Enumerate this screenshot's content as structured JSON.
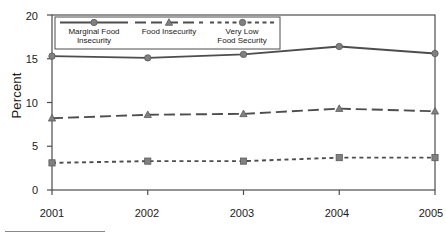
{
  "chart_data": {
    "type": "line",
    "title": "",
    "xlabel": "",
    "ylabel": "Percent",
    "categories": [
      "2001",
      "2002",
      "2003",
      "2004",
      "2005"
    ],
    "x": [
      2001,
      2002,
      2003,
      2004,
      2005
    ],
    "ylim": [
      0,
      20
    ],
    "yticks": [
      0,
      5,
      10,
      15,
      20
    ],
    "ytick_labels": [
      "0",
      "5",
      "10",
      "15",
      "20"
    ],
    "grid": false,
    "legend_position": "upper-left-inside",
    "series": [
      {
        "name": "Marginal Food Insecurity",
        "marker": "circle",
        "linestyle": "solid",
        "color": "#4d4d4d",
        "values": [
          15.3,
          15.1,
          15.5,
          16.4,
          15.6
        ]
      },
      {
        "name": "Food Insecurity",
        "marker": "triangle",
        "linestyle": "dashed",
        "color": "#4d4d4d",
        "values": [
          8.2,
          8.6,
          8.7,
          9.3,
          9.0
        ]
      },
      {
        "name": "Very Low Food Security",
        "marker": "square",
        "linestyle": "dotted",
        "color": "#4d4d4d",
        "values": [
          3.1,
          3.3,
          3.3,
          3.7,
          3.7
        ]
      }
    ]
  },
  "axes": {
    "ylabel": "Percent",
    "ytick_labels": [
      "20",
      "15",
      "10",
      "5",
      "0"
    ],
    "xtick_labels": [
      "2001",
      "2002",
      "2003",
      "2004",
      "2005"
    ]
  },
  "legend": {
    "items": [
      {
        "line1": "Marginal Food",
        "line2": "Insecurity",
        "style": "solid",
        "marker": "circle"
      },
      {
        "line1": "Food Insecurity",
        "line2": "",
        "style": "dashed",
        "marker": "triangle"
      },
      {
        "line1": "Very Low",
        "line2": "Food Security",
        "style": "dotted",
        "marker": "circle"
      }
    ]
  },
  "colors": {
    "line": "#4d4d4d",
    "marker": "#808080",
    "frame": "#4d4d4d",
    "text": "#1a1a1a"
  }
}
